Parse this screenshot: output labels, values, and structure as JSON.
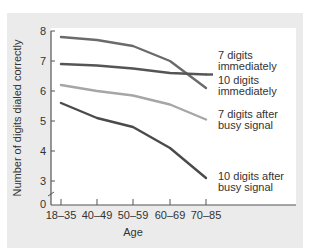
{
  "chart_data": {
    "type": "line",
    "title": "",
    "xlabel": "Age",
    "ylabel": "Number of digits dialed correctly",
    "categories": [
      "18–35",
      "40–49",
      "50–59",
      "60–69",
      "70–85"
    ],
    "yticks": [
      "0",
      "3",
      "4",
      "5",
      "6",
      "7",
      "8"
    ],
    "ylim": [
      3,
      8
    ],
    "axis_break": true,
    "grid": false,
    "legend_position": "inline-right",
    "series": [
      {
        "name": "10 digits immediately",
        "label_lines": [
          "10 digits",
          "immediately"
        ],
        "color": "#6b6b6b",
        "values": [
          7.8,
          7.7,
          7.5,
          7.0,
          6.1
        ]
      },
      {
        "name": "7 digits immediately",
        "label_lines": [
          "7 digits",
          "immediately"
        ],
        "color": "#555555",
        "values": [
          6.9,
          6.85,
          6.75,
          6.6,
          6.55
        ]
      },
      {
        "name": "7 digits after busy signal",
        "label_lines": [
          "7 digits after",
          "busy signal"
        ],
        "color": "#a6a6a6",
        "values": [
          6.2,
          6.0,
          5.85,
          5.55,
          5.05
        ]
      },
      {
        "name": "10 digits after busy signal",
        "label_lines": [
          "10 digits after",
          "busy signal"
        ],
        "color": "#4a4a4a",
        "values": [
          5.6,
          5.1,
          4.8,
          4.1,
          3.1
        ]
      }
    ]
  }
}
